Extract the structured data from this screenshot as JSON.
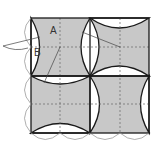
{
  "diagram": {
    "labels": [
      {
        "id": "A",
        "text": "A",
        "x": 50,
        "y": 34
      },
      {
        "id": "B",
        "text": "B",
        "x": 34,
        "y": 56
      }
    ],
    "colors": {
      "fill": "#c8c8c8",
      "stroke": "#1a1a1a",
      "dashed": "#666666",
      "outer_arc": "#9a9a9a",
      "background": "#ffffff"
    },
    "grid": {
      "x0": 31,
      "y0": 18,
      "size": 118,
      "cell": 59
    }
  }
}
